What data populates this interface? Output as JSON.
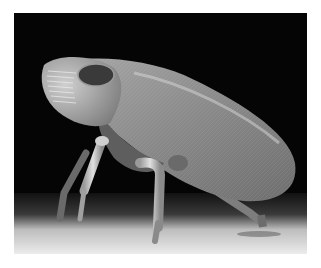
{
  "image": {
    "subject": "leafhopper insect (scanning electron micrograph)",
    "style": "grayscale",
    "colors": {
      "page_background": "#ffffff",
      "photo_background": "#050505",
      "ground_light": "#e6e6e6",
      "ground_dark": "#2a2a2a",
      "body_mid": "#8a8a8a",
      "body_light": "#c8c8c8",
      "eye_dark": "#3a3a3a"
    }
  }
}
